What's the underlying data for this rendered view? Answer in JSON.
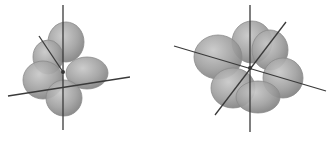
{
  "diagram": {
    "type": "orbital-lobes",
    "background": "#ffffff",
    "lobe_color": "#9a9a9a",
    "lobe_highlight": "#c4c4c4",
    "axis_color": "#3a3a3a",
    "figures": [
      {
        "id": "left-orbital",
        "center": [
          63,
          72
        ],
        "lobes": [
          {
            "cx": 66,
            "cy": 42,
            "rx": 18,
            "ry": 20
          },
          {
            "cx": 48,
            "cy": 57,
            "rx": 15,
            "ry": 17
          },
          {
            "cx": 87,
            "cy": 73,
            "rx": 21,
            "ry": 16
          },
          {
            "cx": 43,
            "cy": 80,
            "rx": 20,
            "ry": 19
          },
          {
            "cx": 64,
            "cy": 98,
            "rx": 18,
            "ry": 18
          }
        ],
        "axes": [
          {
            "x1": 63,
            "y1": 5,
            "x2": 63,
            "y2": 130
          },
          {
            "x1": 8,
            "y1": 96,
            "x2": 130,
            "y2": 77
          },
          {
            "x1": 39,
            "y1": 36,
            "x2": 63,
            "y2": 72
          }
        ]
      },
      {
        "id": "right-orbital",
        "center": [
          250,
          68
        ],
        "lobes": [
          {
            "cx": 252,
            "cy": 42,
            "rx": 20,
            "ry": 21
          },
          {
            "cx": 270,
            "cy": 50,
            "rx": 18,
            "ry": 20
          },
          {
            "cx": 218,
            "cy": 57,
            "rx": 24,
            "ry": 22
          },
          {
            "cx": 283,
            "cy": 78,
            "rx": 20,
            "ry": 20
          },
          {
            "cx": 233,
            "cy": 88,
            "rx": 22,
            "ry": 20
          },
          {
            "cx": 258,
            "cy": 97,
            "rx": 22,
            "ry": 16
          }
        ],
        "axes": [
          {
            "x1": 250,
            "y1": 5,
            "x2": 250,
            "y2": 132
          },
          {
            "x1": 174,
            "y1": 46,
            "x2": 326,
            "y2": 91
          },
          {
            "x1": 286,
            "y1": 22,
            "x2": 215,
            "y2": 115
          }
        ]
      }
    ]
  }
}
